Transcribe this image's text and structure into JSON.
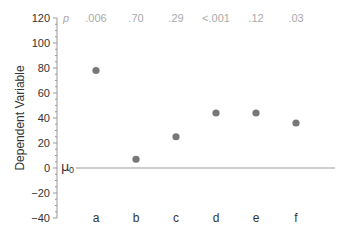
{
  "chart_data": {
    "type": "scatter",
    "title": "",
    "xlabel": "",
    "ylabel": "Dependent Variable",
    "ylim": [
      -40,
      120
    ],
    "yticks": [
      120,
      100,
      80,
      60,
      40,
      20,
      0,
      -20,
      -40
    ],
    "yminor_step": 5,
    "grid": false,
    "categories": [
      "a",
      "b",
      "c",
      "d",
      "e",
      "f"
    ],
    "values": [
      78,
      7,
      25,
      44,
      44,
      36
    ],
    "p_label": "p",
    "p_values": [
      ".006",
      ".70",
      ".29",
      "<.001",
      ".12",
      ".03"
    ],
    "reference_line": {
      "label": "μ",
      "subscript": "0",
      "value": 0
    },
    "colors": {
      "point": "#777777",
      "axis": "#999999",
      "p_text": "#aaaaaa",
      "ref_line": "#999999"
    }
  }
}
